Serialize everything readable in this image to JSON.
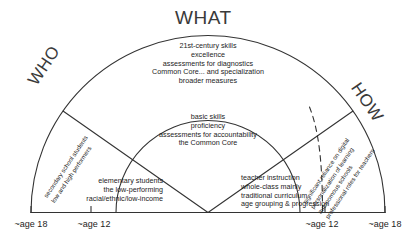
{
  "figure": {
    "title_top": "WHAT",
    "title_left": "WHO",
    "title_right": "HOW",
    "stroke_color": "#333333",
    "text_color": "#1d1d1d"
  },
  "sectors": {
    "outer_what": {
      "name": "what-outer",
      "lines": [
        "21st-century skills",
        "excellence",
        "assessments for diagnostics",
        "Common Core... and specialization",
        "broader measures"
      ]
    },
    "inner_what": {
      "name": "what-inner",
      "lines": [
        "basic skills",
        "proficiency",
        "assessments for accountability",
        "the Common Core"
      ]
    },
    "outer_who": {
      "name": "who-outer",
      "lines": [
        "secondary school students",
        "low and high performers"
      ]
    },
    "inner_who": {
      "name": "who-inner",
      "lines": [
        "elementary students",
        "the low-performing",
        "racial/ethnic/low-income"
      ]
    },
    "outer_how": {
      "name": "how-outer",
      "lines": [
        "significant reliance on digital",
        "personalization of learning",
        "autonomous schools",
        "professional roles for teachers"
      ]
    },
    "inner_how": {
      "name": "how-inner",
      "lines": [
        "teacher instruction",
        "whole-class mainly",
        "traditional curriculum",
        "age grouping & progression"
      ]
    }
  },
  "axis": {
    "left_outer": "~age 18",
    "left_inner": "~age 12",
    "right_inner": "~age 12",
    "right_outer": "~age 18"
  }
}
